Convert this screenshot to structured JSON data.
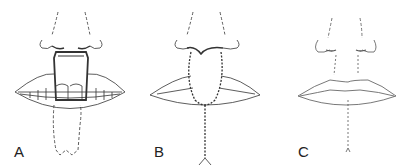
{
  "figure": {
    "panels": [
      {
        "label": "A",
        "description": "Flap elevated from lower lip and rotated into upper lip defect; teeth visible; donor site outlined with dashed lines"
      },
      {
        "label": "B",
        "description": "Flap sutured into upper lip; lower lip donor site closed with sutures"
      },
      {
        "label": "C",
        "description": "Healed result showing reconstructed lips with faint scar lines"
      }
    ]
  },
  "colors": {
    "line": "#333333",
    "background": "#ffffff"
  }
}
